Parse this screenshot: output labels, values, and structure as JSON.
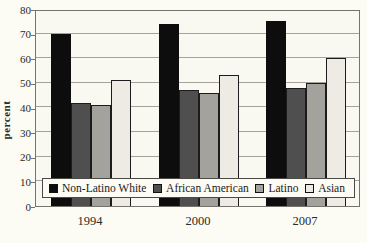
{
  "chart_data": {
    "type": "bar",
    "title": "",
    "ylabel": "percent",
    "xlabel": "",
    "ylim": [
      0,
      80
    ],
    "ytick_step": 10,
    "grid": true,
    "legend_position": "bottom-overlay",
    "categories": [
      "1994",
      "2000",
      "2007"
    ],
    "series": [
      {
        "name": "Non-Latino White",
        "color": "#0d0d0d",
        "values": [
          70,
          74,
          75
        ]
      },
      {
        "name": "African American",
        "color": "#4f4f4f",
        "values": [
          42,
          47,
          48
        ]
      },
      {
        "name": "Latino",
        "color": "#a3a29c",
        "values": [
          41,
          46,
          50
        ]
      },
      {
        "name": "Asian",
        "color": "#edebe3",
        "values": [
          51,
          53,
          60
        ]
      }
    ]
  },
  "colors": {
    "background": "#fcfbf4",
    "plot_background": "#faf9f1",
    "gridline": "#a5a399",
    "frame": "#75736c",
    "text": "#2a2a26"
  }
}
